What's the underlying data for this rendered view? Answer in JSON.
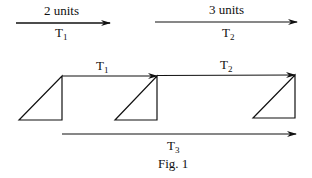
{
  "top_vectors": [
    {
      "length_label": "2 units",
      "name": "T",
      "sub": "1"
    },
    {
      "length_label": "3 units",
      "name": "T",
      "sub": "2"
    }
  ],
  "chain_vectors": [
    {
      "name": "T",
      "sub": "1"
    },
    {
      "name": "T",
      "sub": "2"
    }
  ],
  "resultant": {
    "name": "T",
    "sub": "3"
  },
  "caption": "Fig. 1",
  "colors": {
    "stroke": "#111111",
    "background": "#ffffff"
  }
}
